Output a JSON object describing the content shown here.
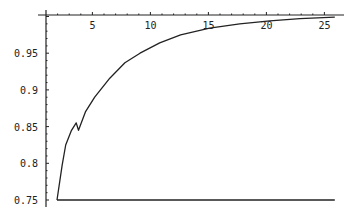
{
  "chart_data": {
    "type": "line",
    "title": "",
    "xlabel": "",
    "ylabel": "",
    "xlim": [
      1,
      25.5
    ],
    "ylim": [
      0.75,
      1.0
    ],
    "x_axis_position": "top",
    "axes_origin": {
      "x": 1,
      "y": 1.0
    },
    "grid": false,
    "legend": null,
    "x_ticks": [
      5,
      10,
      15,
      20,
      25
    ],
    "x_tick_labels": [
      "5",
      "10",
      "15",
      "20",
      "25"
    ],
    "y_ticks": [
      0.75,
      0.8,
      0.85,
      0.9,
      0.95
    ],
    "y_tick_labels": [
      "0.75",
      "0.8",
      "0.85",
      "0.9",
      "0.95"
    ],
    "series": [
      {
        "name": "curve",
        "color": "#222222",
        "x": [
          1.95,
          2.4,
          2.7,
          3.2,
          3.6,
          3.8,
          4.4,
          5.2,
          6.5,
          7.8,
          9.1,
          10.8,
          12.6,
          15.1,
          17.7,
          20.3,
          22.9,
          25.9
        ],
        "y": [
          0.75,
          0.798,
          0.825,
          0.845,
          0.855,
          0.845,
          0.87,
          0.89,
          0.916,
          0.937,
          0.95,
          0.964,
          0.975,
          0.984,
          0.99,
          0.994,
          0.997,
          0.999
        ]
      },
      {
        "name": "baseline",
        "color": "#222222",
        "x": [
          1.95,
          25.9
        ],
        "y": [
          0.75,
          0.75
        ]
      }
    ]
  },
  "colors": {
    "axis": "#222222",
    "line": "#222222",
    "background": "#ffffff"
  }
}
